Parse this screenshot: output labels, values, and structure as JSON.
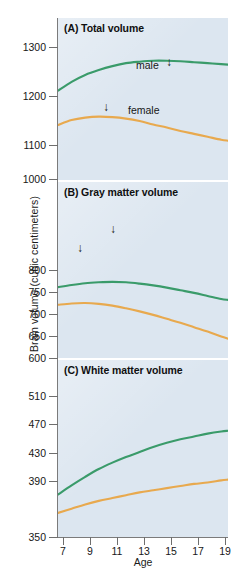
{
  "figure": {
    "y_axis_title": "Brain volume (cubic centimeters)",
    "x_axis_title": "Age",
    "colors": {
      "male": "#3a9b6a",
      "female": "#e8a94e",
      "plot_background": "#dce6f0",
      "axis": "#6e6e6e"
    }
  },
  "panels": [
    {
      "id": "A",
      "title": "(A) Total volume",
      "yticks": [
        "1300",
        "1200",
        "1100",
        "1000"
      ],
      "annotations": [
        {
          "name": "male-label",
          "text": "male"
        },
        {
          "name": "female-label",
          "text": "female"
        },
        {
          "name": "male-peak-arrow",
          "text": "↓"
        },
        {
          "name": "female-peak-arrow",
          "text": "↓"
        }
      ]
    },
    {
      "id": "B",
      "title": "(B) Gray matter volume",
      "yticks": [
        "800",
        "750",
        "700",
        "650",
        "600"
      ],
      "annotations": [
        {
          "name": "male-peak-arrow",
          "text": "↓"
        },
        {
          "name": "female-peak-arrow",
          "text": "↓"
        }
      ]
    },
    {
      "id": "C",
      "title": "(C) White matter volume",
      "yticks": [
        "510",
        "470",
        "430",
        "390",
        "350"
      ],
      "annotations": []
    }
  ],
  "xticks": [
    "7",
    "9",
    "11",
    "13",
    "15",
    "17",
    "19"
  ],
  "chart_data": {
    "type": "line",
    "xlabel": "Age",
    "ylabel": "Brain volume (cubic centimeters)",
    "x": [
      7,
      8,
      9,
      10,
      11,
      12,
      13,
      14,
      15,
      16,
      17,
      18,
      19,
      19.5
    ],
    "panels": [
      {
        "panel": "A",
        "panel_title": "(A) Total volume",
        "ylim": [
          1000,
          1330
        ],
        "yticks": [
          1000,
          1100,
          1200,
          1300
        ],
        "grid": false,
        "legend": "inline labels on curves",
        "annotations": [
          {
            "label": "male",
            "x": 13.5,
            "y": 1272,
            "type": "text"
          },
          {
            "label": "↓",
            "x": 15.0,
            "y": 1272,
            "type": "peak-arrow",
            "series": "male",
            "peak_age": 14.5
          },
          {
            "label": "female",
            "x": 13.0,
            "y": 1146,
            "type": "text"
          },
          {
            "label": "↓",
            "x": 10.8,
            "y": 1152,
            "type": "peak-arrow",
            "series": "female",
            "peak_age": 10.5
          }
        ],
        "series": [
          {
            "name": "male",
            "color": "#3a9b6a",
            "values": [
              1182,
              1200,
              1214,
              1224,
              1232,
              1238,
              1241,
              1243,
              1243,
              1242,
              1240,
              1238,
              1236,
              1235
            ]
          },
          {
            "name": "female",
            "color": "#e8a94e",
            "values": [
              1112,
              1122,
              1127,
              1129,
              1128,
              1125,
              1120,
              1113,
              1107,
              1100,
              1094,
              1088,
              1082,
              1080
            ]
          }
        ]
      },
      {
        "panel": "B",
        "panel_title": "(B) Gray matter volume",
        "ylim": [
          600,
          1000
        ],
        "yticks": [
          600,
          650,
          700,
          750,
          800
        ],
        "grid": false,
        "annotations": [
          {
            "label": "↓",
            "x": 11.0,
            "y": 787,
            "type": "peak-arrow",
            "series": "male",
            "peak_age": 11.0
          },
          {
            "label": "↓",
            "x": 8.6,
            "y": 736,
            "type": "peak-arrow",
            "series": "female",
            "peak_age": 8.5
          }
        ],
        "series": [
          {
            "name": "male",
            "color": "#3a9b6a",
            "values": [
              761,
              766,
              770,
              772,
              773,
              772,
              769,
              765,
              760,
              754,
              748,
              741,
              734,
              732
            ]
          },
          {
            "name": "female",
            "color": "#e8a94e",
            "values": [
              721,
              724,
              725,
              723,
              719,
              713,
              706,
              698,
              689,
              680,
              670,
              660,
              649,
              644
            ]
          }
        ]
      },
      {
        "panel": "C",
        "panel_title": "(C) White matter volume",
        "ylim": [
          350,
          600
        ],
        "yticks": [
          350,
          390,
          430,
          470,
          510
        ],
        "grid": false,
        "annotations": [],
        "series": [
          {
            "name": "male",
            "color": "#3a9b6a",
            "values": [
              410,
              423,
              435,
              446,
              455,
              463,
              470,
              477,
              483,
              488,
              492,
              496,
              499,
              500
            ]
          },
          {
            "name": "female",
            "color": "#e8a94e",
            "values": [
              384,
              390,
              396,
              401,
              405,
              409,
              413,
              416,
              419,
              422,
              425,
              427,
              430,
              431
            ]
          }
        ]
      }
    ]
  }
}
